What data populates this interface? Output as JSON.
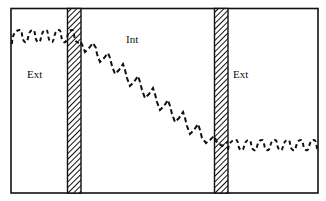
{
  "diagram": {
    "compartments": [
      {
        "id": "left",
        "label": "Ext"
      },
      {
        "id": "middle",
        "label": "Int"
      },
      {
        "id": "right",
        "label": "Ext"
      }
    ],
    "membranes": [
      {
        "id": "left-membrane",
        "x": 67,
        "width": 14,
        "pattern": "diagonal-hatch"
      },
      {
        "id": "right-membrane",
        "x": 214,
        "width": 14,
        "pattern": "diagonal-hatch"
      }
    ],
    "profile": {
      "style": "dashed sawtooth",
      "segments": [
        {
          "region": "left",
          "trend": "flat",
          "level_y": 36
        },
        {
          "region": "middle",
          "trend": "descending",
          "from_y": 40,
          "to_y": 140
        },
        {
          "region": "right",
          "trend": "flat",
          "level_y": 146
        }
      ]
    },
    "colors": {
      "stroke": "#111111",
      "background": "#ffffff"
    }
  }
}
